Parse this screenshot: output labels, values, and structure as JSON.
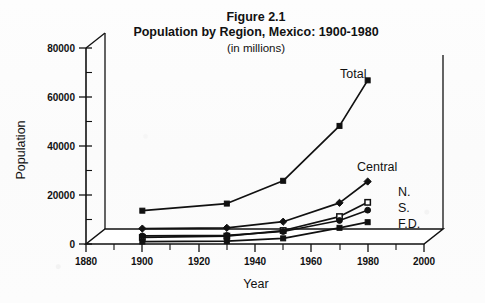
{
  "figure": {
    "title_line1": "Figure 2.1",
    "title_line2": "Population by Region,  Mexico: 1900-1980",
    "subtitle": "(in millions)"
  },
  "axes": {
    "y_axis_title": "Population",
    "x_axis_title": "Year",
    "y_ticks": [
      "0",
      "20000",
      "40000",
      "60000",
      "80000"
    ],
    "x_ticks": [
      "1880",
      "1900",
      "1920",
      "1940",
      "1960",
      "1980",
      "2000"
    ]
  },
  "series_labels": {
    "total": "Total",
    "central": "Central",
    "north": "N.",
    "south": "S.",
    "fd": "F.D."
  },
  "chart_data": {
    "type": "line",
    "xlabel": "Year",
    "ylabel": "Population",
    "xlim": [
      1880,
      2000
    ],
    "ylim": [
      0,
      80000
    ],
    "x_tick_values": [
      1880,
      1900,
      1920,
      1940,
      1960,
      1980,
      2000
    ],
    "y_tick_values": [
      0,
      20000,
      40000,
      60000,
      80000
    ],
    "y_minor_tick_values": [
      10000,
      30000,
      50000,
      70000
    ],
    "x_minor_tick_values": [
      1890,
      1910,
      1930,
      1950,
      1970,
      1990
    ],
    "grid": false,
    "legend_position": "inline-right-of-line-ends",
    "x": [
      1900,
      1930,
      1950,
      1970,
      1980
    ],
    "series": [
      {
        "name": "Total",
        "marker": "filled-square",
        "values": [
          13600,
          16500,
          25800,
          48200,
          66800
        ]
      },
      {
        "name": "Central",
        "marker": "filled-diamond",
        "values": [
          6300,
          6600,
          9100,
          16800,
          25500
        ]
      },
      {
        "name": "N.",
        "marker": "open-square",
        "values": [
          2700,
          3200,
          5500,
          11200,
          17000
        ]
      },
      {
        "name": "S.",
        "marker": "filled-circle",
        "values": [
          3300,
          3500,
          5100,
          9600,
          13800
        ]
      },
      {
        "name": "F.D.",
        "marker": "filled-square",
        "values": [
          1000,
          1200,
          2300,
          6600,
          8900
        ]
      }
    ],
    "annotations": [
      {
        "text": "Total",
        "near_year": 1975,
        "near_value": 71000
      },
      {
        "text": "Central",
        "near_year": 1972,
        "near_value": 33000
      },
      {
        "text": "N.",
        "near_year": 1985,
        "near_value": 22000
      },
      {
        "text": "S.",
        "near_year": 1985,
        "near_value": 16500
      },
      {
        "text": "F.D.",
        "near_year": 1985,
        "near_value": 11000
      }
    ]
  }
}
